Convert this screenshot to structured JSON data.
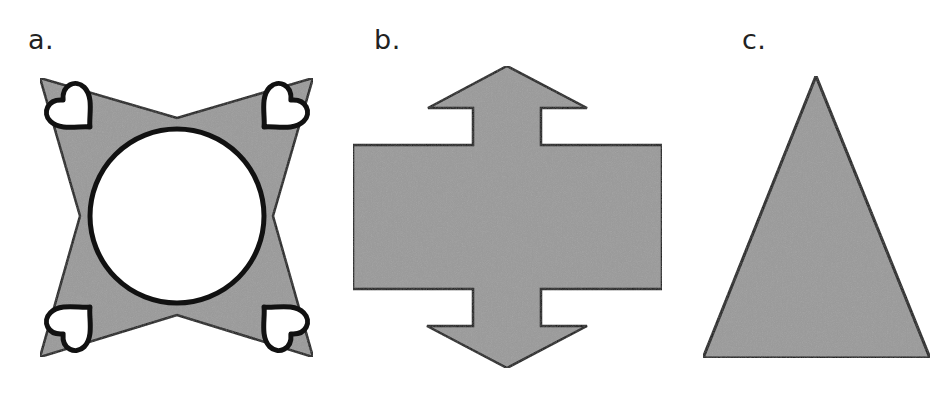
{
  "figure": {
    "colors": {
      "fill": "#9a9a9a",
      "stroke": "#111111",
      "inner": "#ffffff",
      "background": "#ffffff"
    },
    "panels": [
      {
        "label": "a.",
        "shape": "four-pointed star with central circle and four hearts at the corners"
      },
      {
        "label": "b.",
        "shape": "rectangle with double-headed vertical arrow"
      },
      {
        "label": "c.",
        "shape": "isosceles triangle"
      }
    ]
  }
}
